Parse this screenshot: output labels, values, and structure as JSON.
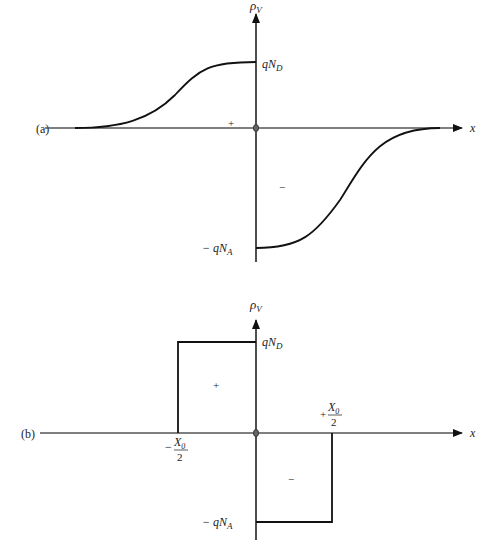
{
  "figure": {
    "panel_a": {
      "label": "(a)",
      "y_axis_label": "ρ",
      "y_axis_sub": "V",
      "x_axis_label": "x",
      "top_level_label": "qN",
      "top_level_sub": "D",
      "bottom_level_label": "− qN",
      "bottom_level_sub": "A",
      "positive_region_sign": "+",
      "negative_region_sign": "−",
      "profile": "graded (smooth S-curves)"
    },
    "panel_b": {
      "label": "(b)",
      "y_axis_label": "ρ",
      "y_axis_sub": "V",
      "x_axis_label": "x",
      "top_level_label": "qN",
      "top_level_sub": "D",
      "bottom_level_label": "− qN",
      "bottom_level_sub": "A",
      "positive_region_sign": "+",
      "negative_region_sign": "−",
      "left_edge_sign": "−",
      "left_edge_num": "X",
      "left_edge_num_sub": "0",
      "left_edge_den": "2",
      "right_edge_sign": "+",
      "right_edge_num": "X",
      "right_edge_num_sub": "0",
      "right_edge_den": "2",
      "profile": "abrupt (rectangular)"
    }
  }
}
